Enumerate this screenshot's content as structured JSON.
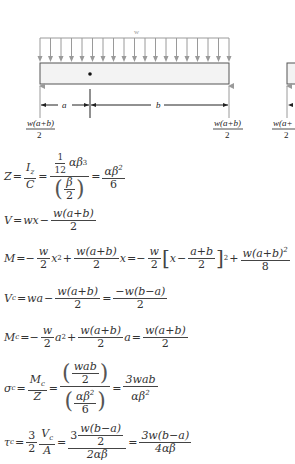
{
  "diagram": {
    "load_label": "w",
    "arrow_count": 19,
    "dim_a": "a",
    "dim_b": "b",
    "reaction_left": {
      "num": "w(a+b)",
      "den": "2"
    },
    "reaction_right": {
      "num": "w(a+b)",
      "den": "2"
    },
    "reaction_partial": {
      "num": "w(a+",
      "den": "2"
    },
    "colors": {
      "arrow": "#9a9a9a",
      "beam_fill": "#f3f3f3",
      "beam_stroke": "#555555",
      "dim": "#222222"
    }
  },
  "equations": {
    "Z": {
      "lhs": "Z",
      "t1": {
        "num": "I",
        "num_sub": "z",
        "den": "C"
      },
      "t2_num_frac": {
        "num": "1",
        "den": "12"
      },
      "t2_num_rest": "αβ",
      "t2_num_sup": "3",
      "t2_den_frac": {
        "num": "β",
        "den": "2"
      },
      "t3": {
        "num": "αβ",
        "num_sup": "2",
        "den": "6"
      }
    },
    "V": {
      "lhs": "V",
      "t1": "wx",
      "minus": "−",
      "t2": {
        "num": "w(a+b)",
        "den": "2"
      }
    },
    "M": {
      "lhs": "M",
      "t1": {
        "num": "w",
        "den": "2"
      },
      "x2": "x",
      "sup2": "2",
      "t2": {
        "num": "w(a+b)",
        "den": "2"
      },
      "x": "x",
      "t3": {
        "num": "w",
        "den": "2"
      },
      "bracket_x": "x",
      "t4": {
        "num": "a+b",
        "den": "2"
      },
      "t5": {
        "num": "w(a+b)",
        "num_sup": "2",
        "den": "8"
      }
    },
    "Vc": {
      "lhs": "V",
      "sub": "c",
      "t1": "wa",
      "t2": {
        "num": "w(a+b)",
        "den": "2"
      },
      "t3": {
        "num": "−w(b−a)",
        "den": "2"
      }
    },
    "Mc": {
      "lhs": "M",
      "sub": "c",
      "t1": {
        "num": "w",
        "den": "2"
      },
      "a2": "a",
      "sup2": "2",
      "t2": {
        "num": "w(a+b)",
        "den": "2"
      },
      "a": "a",
      "t3": {
        "num": "w(a+b)",
        "den": "2"
      }
    },
    "sigma": {
      "lhs": "σ",
      "sub": "c",
      "t1": {
        "num": "M",
        "num_sub": "c",
        "den": "Z"
      },
      "t2_num": {
        "num": "wab",
        "den": "2"
      },
      "t2_den": {
        "num": "αβ",
        "num_sup": "2",
        "den": "6"
      },
      "t3": {
        "num": "3wab",
        "den": "αβ",
        "den_sup": "2"
      }
    },
    "tau": {
      "lhs": "τ",
      "sub": "c",
      "t1": {
        "num": "3",
        "den": "2"
      },
      "t2": {
        "num": "V",
        "num_sub": "c",
        "den": "A"
      },
      "t3_coef": "3",
      "t3_inner": {
        "num": "w(b−a)",
        "den": "2"
      },
      "t3_den": "2αβ",
      "t4": {
        "num": "3w(b−a)",
        "den": "4αβ"
      }
    }
  }
}
